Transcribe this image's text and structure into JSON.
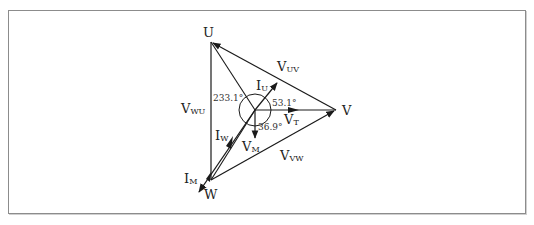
{
  "diagram": {
    "points": {
      "U": {
        "label": "U",
        "x": 211,
        "y": 42
      },
      "V": {
        "label": "V",
        "x": 336,
        "y": 110
      },
      "W": {
        "label": "W",
        "x": 211,
        "y": 180
      },
      "O": {
        "x": 255,
        "y": 110
      }
    },
    "labels": {
      "U": "U",
      "V": "V",
      "W": "W",
      "V_UV": {
        "main": "V",
        "sub": "UV"
      },
      "V_WU": {
        "main": "V",
        "sub": "WU"
      },
      "V_VW": {
        "main": "V",
        "sub": "VW"
      },
      "V_T": {
        "main": "V",
        "sub": "T"
      },
      "V_M": {
        "main": "V",
        "sub": "M"
      },
      "I_U": {
        "main": "I",
        "sub": "U"
      },
      "I_W": {
        "main": "I",
        "sub": "W"
      },
      "I_M": {
        "main": "I",
        "sub": "M"
      }
    },
    "angles": {
      "a1": "233.1°",
      "a2": "53.1°",
      "a3": "36.9°"
    },
    "colors": {
      "line": "#1a1a1a",
      "border": "#8c8c8c"
    }
  }
}
